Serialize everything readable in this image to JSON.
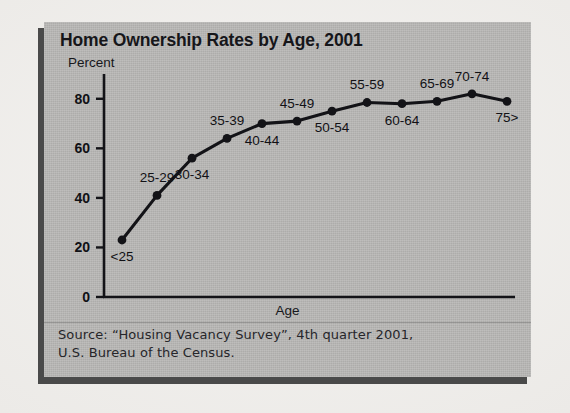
{
  "figure": {
    "title": "Home Ownership Rates by Age, 2001",
    "source_lines": [
      "Source: “Housing Vacancy Survey”, 4th quarter 2001,",
      "U.S. Bureau of the Census."
    ],
    "panel_color": "#b9b8b6",
    "ink_color": "#111115",
    "page_color": "#efeeec"
  },
  "chart_data": {
    "type": "line",
    "title": "Home Ownership Rates by Age, 2001",
    "xlabel": "Age",
    "ylabel": "Percent",
    "ylim": [
      0,
      90
    ],
    "yticks": [
      0,
      20,
      40,
      60,
      80
    ],
    "grid": false,
    "legend": "none",
    "marker": "filled-circle",
    "categories": [
      "<25",
      "25-29",
      "30-34",
      "35-39",
      "40-44",
      "45-49",
      "50-54",
      "55-59",
      "60-64",
      "65-69",
      "70-74",
      "75>"
    ],
    "values": [
      23,
      41,
      56,
      64,
      70,
      71,
      75,
      78.5,
      78,
      79,
      82,
      79
    ],
    "label_positions": [
      "below",
      "above",
      "below",
      "above",
      "below",
      "above",
      "below",
      "above",
      "below",
      "above",
      "above",
      "below"
    ],
    "annotations": []
  }
}
